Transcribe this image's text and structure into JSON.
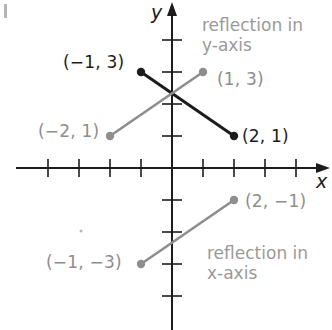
{
  "chart_data": {
    "type": "line",
    "title": "",
    "xlabel": "x",
    "ylabel": "y",
    "xlim": [
      -4,
      4
    ],
    "ylim": [
      -4,
      5
    ],
    "grid": false,
    "tick_marks": {
      "x": [
        -4,
        -3,
        -2,
        -1,
        1,
        2,
        3,
        4
      ],
      "y": [
        -4,
        -3,
        -2,
        -1,
        1,
        2,
        3,
        4
      ]
    },
    "series": [
      {
        "name": "original segment",
        "color": "#1c1c1c",
        "points": [
          [
            -1,
            3
          ],
          [
            2,
            1
          ]
        ]
      },
      {
        "name": "reflection in y-axis",
        "color": "#8e8e8e",
        "points": [
          [
            -2,
            1
          ],
          [
            1,
            3
          ]
        ]
      },
      {
        "name": "reflection in x-axis",
        "color": "#8e8e8e",
        "points": [
          [
            -1,
            -3
          ],
          [
            2,
            -1
          ]
        ]
      }
    ],
    "annotations": [
      {
        "text": "reflection in y-axis",
        "near": [
          2.5,
          4
        ]
      },
      {
        "text": "reflection in x-axis",
        "near": [
          2.5,
          -2.5
        ]
      }
    ]
  },
  "axes": {
    "x_label": "x",
    "y_label": "y"
  },
  "labels": {
    "p_m1_3": "(−1, 3)",
    "p_2_1": "(2, 1)",
    "p_1_3": "(1, 3)",
    "p_m2_1": "(−2, 1)",
    "p_2_m1": "(2, −1)",
    "p_m1_m3": "(−1, −3)"
  },
  "notes": {
    "y_reflect_line1": "reflection in",
    "y_reflect_line2": "y-axis",
    "x_reflect_line1": "reflection in",
    "x_reflect_line2": "x-axis"
  },
  "colors": {
    "black": "#1c1c1c",
    "gray": "#8e8e8e",
    "note": "#9a9a9a"
  }
}
